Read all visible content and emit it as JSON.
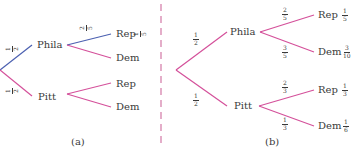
{
  "colors": {
    "highlight": "#4a5fb0",
    "branch": "#d4509a",
    "divider": "#d98cb3",
    "text": "#3a3a3a"
  },
  "diagram_a": {
    "caption": "(a)",
    "root_branches": [
      {
        "to": "Phila",
        "prob": {
          "num": "1",
          "den": "2"
        },
        "highlighted": true
      },
      {
        "to": "Pitt",
        "prob": {
          "num": "1",
          "den": "2"
        },
        "highlighted": false
      }
    ],
    "nodes": {
      "phila": "Phila",
      "pitt": "Pitt"
    },
    "leaves": [
      {
        "label": "Rep",
        "parent": "Phila",
        "branch_prob": {
          "num": "2",
          "den": "5"
        },
        "joint": {
          "num": "1",
          "den": "5"
        },
        "highlighted": true
      },
      {
        "label": "Dem",
        "parent": "Phila"
      },
      {
        "label": "Rep",
        "parent": "Pitt"
      },
      {
        "label": "Dem",
        "parent": "Pitt"
      }
    ]
  },
  "diagram_b": {
    "caption": "(b)",
    "root_branches": [
      {
        "to": "Phila",
        "prob": {
          "num": "1",
          "den": "2"
        }
      },
      {
        "to": "Pitt",
        "prob": {
          "num": "1",
          "den": "2"
        }
      }
    ],
    "nodes": {
      "phila": "Phila",
      "pitt": "Pitt"
    },
    "leaves": [
      {
        "label": "Rep",
        "parent": "Phila",
        "branch_prob": {
          "num": "2",
          "den": "5"
        },
        "joint": {
          "num": "1",
          "den": "5"
        }
      },
      {
        "label": "Dem",
        "parent": "Phila",
        "branch_prob": {
          "num": "3",
          "den": "5"
        },
        "joint": {
          "num": "3",
          "den": "10"
        }
      },
      {
        "label": "Rep",
        "parent": "Pitt",
        "branch_prob": {
          "num": "2",
          "den": "3"
        },
        "joint": {
          "num": "1",
          "den": "3"
        }
      },
      {
        "label": "Dem",
        "parent": "Pitt",
        "branch_prob": {
          "num": "1",
          "den": "3"
        },
        "joint": {
          "num": "1",
          "den": "6"
        }
      }
    ]
  }
}
